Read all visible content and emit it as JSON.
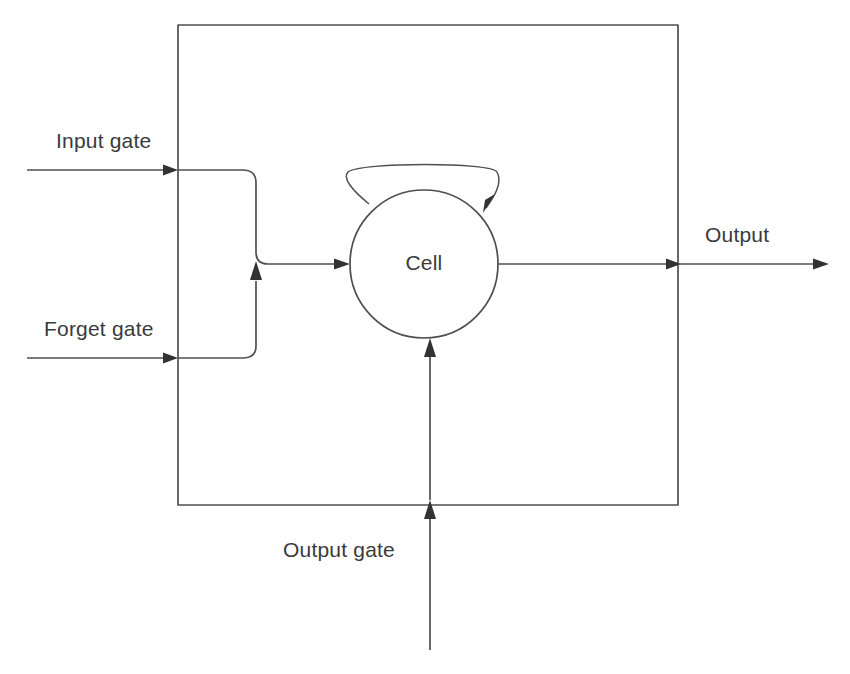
{
  "diagram": {
    "type": "block-diagram",
    "background_color": "#ffffff",
    "line_color": "#4f4f51",
    "text_color": "#3a3a3c",
    "block": {
      "name": "memory-block-boundary",
      "shape": "rectangle",
      "x": 178,
      "y": 25,
      "width": 500,
      "height": 480
    },
    "cell": {
      "label": "Cell",
      "shape": "circle",
      "cx": 424,
      "cy": 264,
      "r": 74
    },
    "self_loop": {
      "name": "recurrent-self-connection",
      "description": "arc from cell upper-left over the top back into cell upper-right",
      "arrow_direction": "down-left"
    },
    "inputs": [
      {
        "id": "input-gate",
        "label": "Input gate",
        "direction": "right",
        "entry_y": 170,
        "start_x": 27,
        "end_x": 178
      },
      {
        "id": "forget-gate",
        "label": "Forget gate",
        "direction": "right",
        "entry_y": 358,
        "start_x": 27,
        "end_x": 178
      },
      {
        "id": "output-gate",
        "label": "Output gate",
        "direction": "up",
        "entry_x": 430,
        "start_y": 650,
        "end_y": 338
      }
    ],
    "outputs": [
      {
        "id": "output",
        "label": "Output",
        "direction": "right",
        "y": 264,
        "start_x": 498,
        "end_x": 828
      }
    ]
  }
}
